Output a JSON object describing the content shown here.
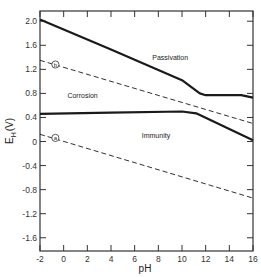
{
  "chart_data": {
    "type": "line",
    "title": "",
    "xlabel": "pH",
    "ylabel": "E_H (V)",
    "ylabel_main": "E",
    "ylabel_sub": "H",
    "ylabel_unit": "(V)",
    "xlim": [
      -2,
      16
    ],
    "ylim": [
      -1.82,
      2.17
    ],
    "grid": false,
    "x_ticks": [
      -2,
      0,
      2,
      4,
      6,
      8,
      10,
      12,
      14,
      16
    ],
    "x_tick_labels": [
      "-2",
      "0",
      "2",
      "4",
      "6",
      "8",
      "10",
      "12",
      "14",
      "16"
    ],
    "y_ticks": [
      2.0,
      1.6,
      1.2,
      0.8,
      0.4,
      0,
      -0.4,
      -0.8,
      -1.2,
      -1.6
    ],
    "y_tick_labels": [
      "2.0",
      "1.6",
      "1.2",
      "0.8",
      "0.4",
      "0",
      "-0.4",
      "-0.8",
      "-1.2",
      "-1.6"
    ],
    "series": [
      {
        "name": "Passivation/Corrosion boundary (upper)",
        "style": "solid-thick",
        "x": [
          -2,
          4,
          10,
          11.5,
          12,
          15,
          16
        ],
        "y": [
          2.03,
          1.53,
          1.02,
          0.8,
          0.77,
          0.77,
          0.73
        ]
      },
      {
        "name": "Corrosion/Immunity boundary (lower)",
        "style": "solid-thick",
        "x": [
          -2,
          4,
          10,
          11.2,
          16
        ],
        "y": [
          0.46,
          0.48,
          0.5,
          0.47,
          0.02
        ]
      },
      {
        "name": "b",
        "style": "dashed",
        "x": [
          -2,
          16
        ],
        "y": [
          1.35,
          0.3
        ]
      },
      {
        "name": "a",
        "style": "dashed",
        "x": [
          -2,
          16
        ],
        "y": [
          0.12,
          -0.94
        ]
      }
    ],
    "annotations": [
      {
        "text": "Passivation",
        "x": 9.0,
        "y": 1.36
      },
      {
        "text": "Corrosion",
        "x": 1.6,
        "y": 0.73
      },
      {
        "text": "Immunity",
        "x": 7.8,
        "y": 0.06
      },
      {
        "text": "b",
        "x": -0.7,
        "y": 1.28,
        "circled": true
      },
      {
        "text": "a",
        "x": -0.7,
        "y": 0.06,
        "circled": true
      }
    ]
  }
}
